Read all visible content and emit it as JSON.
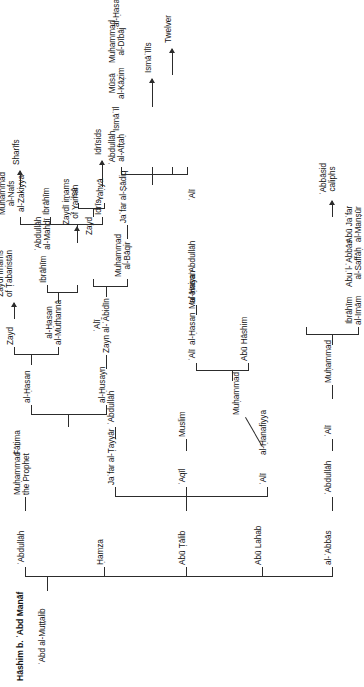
{
  "figure": {
    "title": "Hāshim b. ʿAbd Manāf",
    "type": "genealogical-tree",
    "orientation": "rotated-90-ccw",
    "line_color": "#2c2c2c",
    "text_color": "#131313"
  },
  "generations": {
    "g0": {
      "label": "Hāshim b. ʿAbd Manāf"
    },
    "g1": {
      "label": "ʿAbd al-Muṭṭalib"
    },
    "g2": [
      {
        "label": "ʿAbdullāh"
      },
      {
        "label": "Ḥamza"
      },
      {
        "label": "Abū Ṭālib"
      },
      {
        "label": "Abū Lahab"
      },
      {
        "label": "al-ʿAbbās"
      }
    ],
    "g3": [
      {
        "label": "Muḥammad\nthe Prophet"
      },
      {
        "label": "ʿAlī"
      },
      {
        "label": "al-Ḥanafiyya"
      },
      {
        "label": "ʿAqīl"
      },
      {
        "label": "Jaʿfar al-Ṭayyār"
      },
      {
        "label": "ʿAbdullāh"
      }
    ],
    "g4": [
      {
        "label": "Fāṭima"
      },
      {
        "label": "Muḥammad"
      },
      {
        "label": "Muslim"
      },
      {
        "label": "ʿAbdullāh"
      },
      {
        "label": "ʿAlī"
      }
    ],
    "g5": [
      {
        "label": "al-Ḥasan"
      },
      {
        "label": "al-Ḥusayn"
      },
      {
        "label": "Abū Hāshim"
      },
      {
        "label": "ʿAlī"
      },
      {
        "label": "al-Ḥasan"
      },
      {
        "label": "Muʿāwiya"
      },
      {
        "label": "Muḥammad"
      }
    ],
    "g6": [
      {
        "label": "Zayd"
      },
      {
        "label": "al-Ḥasan\nal-Muthannā"
      },
      {
        "label": "ʿAlī\nZayn al-ʿĀbidīn"
      },
      {
        "label": "al-Ḥasan"
      },
      {
        "label": "ʿAbdullāh"
      },
      {
        "label": "Ibrāhīm\nal-Imām"
      },
      {
        "label": "Abuʾl-ʿAbbās\nal-Saffāḥ"
      },
      {
        "label": "Abū Jaʿfar\nal-Manṣūr"
      }
    ],
    "g7": [
      {
        "label": "Ibrāhīm"
      },
      {
        "label": "ʿAbdullāh\nal-Mahdī"
      },
      {
        "label": "Muḥammad\nal-Bāqir"
      },
      {
        "label": "Zayd"
      },
      {
        "label": "ʿAlī"
      }
    ],
    "g8": [
      {
        "label": "Muḥammad\nal-Nafs\nal-Zakiyya"
      },
      {
        "label": "Ibrāhīm"
      },
      {
        "label": "Idrīs"
      },
      {
        "label": "ʿAbdullāh\nal-Afṭaḥ"
      },
      {
        "label": "Ismāʿīl"
      },
      {
        "label": "Mūsā\nal-Kāẓim"
      },
      {
        "label": "Muḥammad\nal-Dībāj"
      },
      {
        "label": "Yaḥyā"
      },
      {
        "label": "ʿĪsā"
      },
      {
        "label": "Jaʿfar al-Ṣādiq"
      },
      {
        "label": "al-Ḥasan"
      }
    ]
  },
  "terminals": [
    {
      "label": "ʿAbbāsid\ncaliphs",
      "from": "Abū Jaʿfar al-Manṣūr"
    },
    {
      "label": "Zaydī imams\nof Ṭabaristān",
      "from": "Zayd"
    },
    {
      "label": "Zaydī imams\nof Yaman",
      "from": "ʿAbdullāh al-Mahdī"
    },
    {
      "label": "Sharīfs",
      "from": "Muḥammad al-Nafs al-Zakiyya"
    },
    {
      "label": "Idrīsids",
      "from": "Idrīs"
    },
    {
      "label": "Ismāʿīlīs",
      "from": "Ismāʿīl"
    },
    {
      "label": "Twelver",
      "from": "Mūsā al-Kāẓim"
    }
  ],
  "nodes": [
    {
      "id": "n00",
      "name": "hashim-b-abd-manaf",
      "text": "Hāshim b. ʿAbd Manāf",
      "x": 14,
      "y": 20,
      "align": "left",
      "style": "title"
    },
    {
      "id": "n01",
      "name": "abd-al-muttalib",
      "text": "ʿAbd al-Muṭṭalib",
      "x": 14,
      "y": 47,
      "align": "left",
      "style": "node"
    },
    {
      "id": "n10",
      "name": "abdullah-g2",
      "text": "ʿAbdullāh",
      "x": 80,
      "y": 20,
      "align": "left",
      "style": "node"
    },
    {
      "id": "n11",
      "name": "hamza",
      "text": "Ḥamza",
      "x": 80,
      "y": 96,
      "align": "left",
      "style": "node"
    },
    {
      "id": "n12",
      "name": "abu-talib",
      "text": "Abū Ṭālib",
      "x": 80,
      "y": 186,
      "align": "left",
      "style": "node"
    },
    {
      "id": "n13",
      "name": "abu-lahab",
      "text": "Abū Lahab",
      "x": 80,
      "y": 262,
      "align": "left",
      "style": "node"
    },
    {
      "id": "n14",
      "name": "al-abbas",
      "text": "al-ʿAbbās",
      "x": 80,
      "y": 326,
      "align": "left",
      "style": "node"
    }
  ],
  "colors": {
    "background": "#ffffff",
    "line": "#2c2c2c",
    "text": "#131313"
  }
}
